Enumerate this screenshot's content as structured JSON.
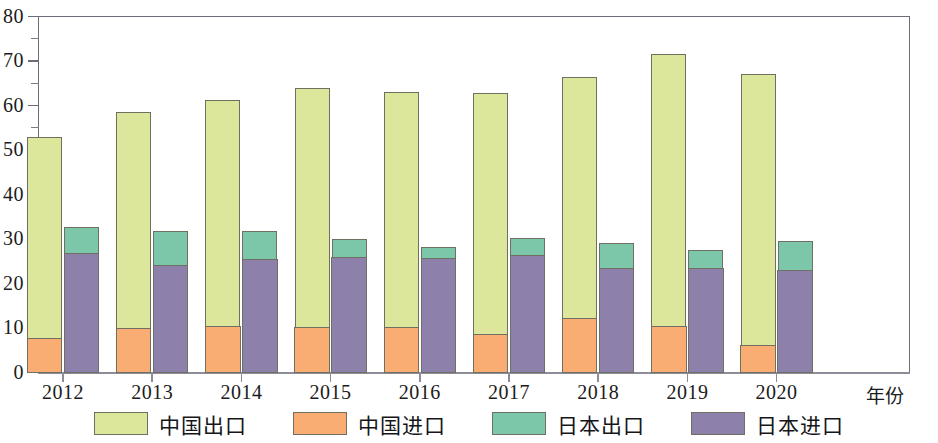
{
  "chart_data": {
    "type": "bar",
    "subtype": "grouped-stacked-bar",
    "title": "",
    "xlabel": "年份",
    "ylabel": "",
    "categories": [
      "2012",
      "2013",
      "2014",
      "2015",
      "2016",
      "2017",
      "2018",
      "2019",
      "2020"
    ],
    "ylim": [
      0,
      80
    ],
    "ytick_labels": [
      "0",
      "10",
      "20",
      "30",
      "40",
      "50",
      "60",
      "70",
      "80"
    ],
    "ytick_values": [
      0,
      10,
      20,
      30,
      40,
      50,
      60,
      70,
      80
    ],
    "yminor_step": 5,
    "grid": false,
    "legend_position": "bottom",
    "series": [
      {
        "name": "中国出口",
        "key": "china_export",
        "color": "#dde79b",
        "group": "china",
        "stack_position": "top",
        "values": [
          52.9,
          58.6,
          61.3,
          64.0,
          63.1,
          62.9,
          66.4,
          71.6,
          67.0
        ]
      },
      {
        "name": "中国进口",
        "key": "china_import",
        "color": "#f9ad72",
        "group": "china",
        "stack_position": "bottom",
        "values": [
          7.8,
          10.0,
          10.5,
          10.3,
          10.3,
          8.7,
          12.3,
          10.5,
          6.3
        ]
      },
      {
        "name": "日本出口",
        "key": "japan_export",
        "color": "#7cc6a9",
        "group": "japan",
        "stack_position": "top",
        "values": [
          32.7,
          31.8,
          31.8,
          30.1,
          28.2,
          30.2,
          29.2,
          27.5,
          29.5
        ]
      },
      {
        "name": "日本进口",
        "key": "japan_import",
        "color": "#8d80ab",
        "group": "japan",
        "stack_position": "bottom",
        "values": [
          27.0,
          24.2,
          25.5,
          26.0,
          25.8,
          26.5,
          23.5,
          23.6,
          23.0
        ]
      }
    ]
  },
  "axis": {
    "x_name": "年份",
    "y_max_label": "80",
    "y_min_label": "0"
  },
  "legend": {
    "items": [
      {
        "label": "中国出口",
        "color": "#dde79b"
      },
      {
        "label": "中国进口",
        "color": "#f9ad72"
      },
      {
        "label": "日本出口",
        "color": "#7cc6a9"
      },
      {
        "label": "日本进口",
        "color": "#8d80ab"
      }
    ]
  }
}
